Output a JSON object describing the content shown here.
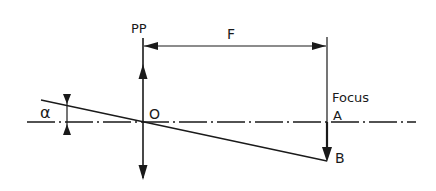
{
  "diagram": {
    "type": "optics-ray-diagram",
    "labels": {
      "principal_plane": "PP",
      "focal_length": "F",
      "focus": "Focus",
      "point_a": "A",
      "point_b": "B",
      "optical_center": "O",
      "angle": "α"
    },
    "colors": {
      "background": "#ffffff",
      "ink": "#1a1a1a"
    }
  }
}
